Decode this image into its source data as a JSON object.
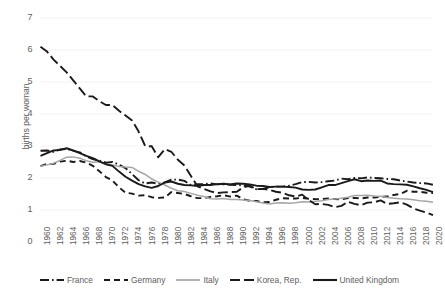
{
  "chart_data": {
    "type": "line",
    "title": "",
    "xlabel": "",
    "ylabel": "births per woman",
    "ylim": [
      0,
      7
    ],
    "ytick_labels": [
      "0",
      "1",
      "2",
      "3",
      "4",
      "5",
      "6",
      "7"
    ],
    "xlim": [
      1960,
      2020
    ],
    "grid": true,
    "grid_axis": "y",
    "legend_position": "bottom",
    "x": [
      1960,
      1961,
      1962,
      1963,
      1964,
      1965,
      1966,
      1967,
      1968,
      1969,
      1970,
      1971,
      1972,
      1973,
      1974,
      1975,
      1976,
      1977,
      1978,
      1979,
      1980,
      1981,
      1982,
      1983,
      1984,
      1985,
      1986,
      1987,
      1988,
      1989,
      1990,
      1991,
      1992,
      1993,
      1994,
      1995,
      1996,
      1997,
      1998,
      1999,
      2000,
      2001,
      2002,
      2003,
      2004,
      2005,
      2006,
      2007,
      2008,
      2009,
      2010,
      2011,
      2012,
      2013,
      2014,
      2015,
      2016,
      2017,
      2018,
      2019,
      2020
    ],
    "xtick_labels": [
      "1960",
      "1962",
      "1964",
      "1966",
      "1968",
      "1970",
      "1972",
      "1974",
      "1976",
      "1978",
      "1980",
      "1982",
      "1984",
      "1986",
      "1988",
      "1990",
      "1992",
      "1994",
      "1996",
      "1998",
      "2000",
      "2002",
      "2004",
      "2006",
      "2008",
      "2010",
      "2012",
      "2014",
      "2016",
      "2018",
      "2020"
    ],
    "series": [
      {
        "name": "France",
        "style": "dash-dot",
        "color": "#1a1a1a",
        "values": [
          2.85,
          2.86,
          2.82,
          2.89,
          2.91,
          2.85,
          2.8,
          2.68,
          2.59,
          2.54,
          2.48,
          2.5,
          2.42,
          2.31,
          2.12,
          1.93,
          1.83,
          1.86,
          1.82,
          1.86,
          1.95,
          1.95,
          1.91,
          1.78,
          1.81,
          1.81,
          1.83,
          1.8,
          1.8,
          1.79,
          1.78,
          1.77,
          1.73,
          1.65,
          1.66,
          1.71,
          1.73,
          1.73,
          1.76,
          1.81,
          1.87,
          1.88,
          1.86,
          1.87,
          1.9,
          1.92,
          1.98,
          1.96,
          2.0,
          1.99,
          2.02,
          2.0,
          1.99,
          1.97,
          1.96,
          1.92,
          1.89,
          1.86,
          1.84,
          1.83,
          1.79
        ]
      },
      {
        "name": "Germany",
        "style": "dashed",
        "color": "#1a1a1a",
        "values": [
          2.37,
          2.44,
          2.44,
          2.51,
          2.54,
          2.5,
          2.53,
          2.48,
          2.38,
          2.21,
          2.03,
          1.92,
          1.71,
          1.54,
          1.51,
          1.45,
          1.46,
          1.4,
          1.38,
          1.39,
          1.56,
          1.53,
          1.5,
          1.43,
          1.37,
          1.37,
          1.41,
          1.43,
          1.46,
          1.42,
          1.45,
          1.33,
          1.29,
          1.28,
          1.24,
          1.25,
          1.32,
          1.37,
          1.36,
          1.36,
          1.38,
          1.35,
          1.34,
          1.34,
          1.36,
          1.34,
          1.33,
          1.37,
          1.38,
          1.36,
          1.39,
          1.39,
          1.41,
          1.42,
          1.47,
          1.5,
          1.6,
          1.57,
          1.57,
          1.54,
          1.53
        ]
      },
      {
        "name": "Italy",
        "style": "solid",
        "color": "#a6a6a6",
        "values": [
          2.37,
          2.41,
          2.46,
          2.55,
          2.65,
          2.66,
          2.62,
          2.54,
          2.49,
          2.51,
          2.43,
          2.41,
          2.36,
          2.34,
          2.33,
          2.21,
          2.11,
          1.97,
          1.87,
          1.78,
          1.68,
          1.6,
          1.58,
          1.52,
          1.46,
          1.42,
          1.35,
          1.34,
          1.36,
          1.33,
          1.33,
          1.31,
          1.3,
          1.26,
          1.22,
          1.19,
          1.22,
          1.23,
          1.21,
          1.23,
          1.26,
          1.25,
          1.27,
          1.29,
          1.33,
          1.34,
          1.37,
          1.4,
          1.45,
          1.45,
          1.46,
          1.44,
          1.43,
          1.39,
          1.37,
          1.35,
          1.34,
          1.32,
          1.29,
          1.27,
          1.24
        ]
      },
      {
        "name": "Korea, Rep.",
        "style": "long-dash",
        "color": "#1a1a1a",
        "values": [
          6.1,
          5.95,
          5.7,
          5.5,
          5.3,
          5.05,
          4.8,
          4.55,
          4.55,
          4.4,
          4.28,
          4.28,
          4.1,
          3.95,
          3.8,
          3.45,
          3.0,
          2.99,
          2.65,
          2.9,
          2.82,
          2.57,
          2.39,
          2.06,
          1.74,
          1.66,
          1.58,
          1.53,
          1.55,
          1.56,
          1.57,
          1.71,
          1.76,
          1.65,
          1.66,
          1.63,
          1.57,
          1.54,
          1.46,
          1.42,
          1.48,
          1.31,
          1.18,
          1.19,
          1.16,
          1.09,
          1.13,
          1.26,
          1.19,
          1.15,
          1.23,
          1.24,
          1.3,
          1.19,
          1.21,
          1.24,
          1.17,
          1.05,
          0.98,
          0.92,
          0.84
        ]
      },
      {
        "name": "United Kingdom",
        "style": "solid",
        "color": "#1a1a1a",
        "values": [
          2.69,
          2.78,
          2.86,
          2.88,
          2.93,
          2.86,
          2.78,
          2.69,
          2.62,
          2.52,
          2.43,
          2.38,
          2.2,
          2.04,
          1.92,
          1.81,
          1.74,
          1.69,
          1.75,
          1.86,
          1.89,
          1.82,
          1.78,
          1.77,
          1.75,
          1.78,
          1.78,
          1.81,
          1.82,
          1.8,
          1.83,
          1.82,
          1.8,
          1.76,
          1.75,
          1.72,
          1.73,
          1.73,
          1.72,
          1.7,
          1.64,
          1.63,
          1.64,
          1.71,
          1.78,
          1.78,
          1.84,
          1.9,
          1.96,
          1.9,
          1.92,
          1.91,
          1.92,
          1.83,
          1.81,
          1.8,
          1.79,
          1.74,
          1.68,
          1.63,
          1.56
        ]
      }
    ]
  },
  "legend": {
    "items": [
      {
        "label": "France",
        "style": "dash-dot",
        "color": "#1a1a1a"
      },
      {
        "label": "Germany",
        "style": "dashed",
        "color": "#1a1a1a"
      },
      {
        "label": "Italy",
        "style": "solid",
        "color": "#a6a6a6"
      },
      {
        "label": "Korea, Rep.",
        "style": "long-dash",
        "color": "#1a1a1a"
      },
      {
        "label": "United Kingdom",
        "style": "solid",
        "color": "#1a1a1a"
      }
    ]
  },
  "axes": {
    "y_title": "births per woman",
    "grid_color": "#f2f2f2"
  }
}
